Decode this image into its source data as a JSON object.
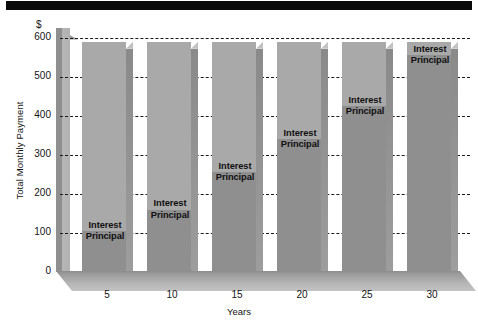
{
  "chart_data": {
    "type": "bar",
    "title": "",
    "subtitle": "",
    "xlabel": "Years",
    "ylabel": "Total Monthly Payment",
    "currency_symbol": "$",
    "categories": [
      "5",
      "10",
      "15",
      "20",
      "25",
      "30"
    ],
    "ytick_labels": [
      "600",
      "500",
      "400",
      "300",
      "200",
      "100",
      "0"
    ],
    "ytick_values": [
      600,
      500,
      400,
      300,
      200,
      100,
      0
    ],
    "ylim": [
      0,
      625
    ],
    "grid": true,
    "grid_style": "dashed-horizontal",
    "legend": "in-bar",
    "stacked": true,
    "series": [
      {
        "name": "Interest",
        "values": [
          485,
          430,
          335,
          250,
          165,
          35
        ]
      },
      {
        "name": "Principal",
        "values": [
          105,
          160,
          255,
          340,
          425,
          555
        ]
      }
    ],
    "totals": [
      590,
      590,
      590,
      590,
      590,
      590
    ],
    "bar_labels": [
      "Interest",
      "Principal"
    ],
    "colors": {
      "interest": "#a9a9a9",
      "principal": "#8f8f8f",
      "bar_side": "#8a8a8a",
      "floor": "#b4b4b4",
      "back_wall": "#9a9a9a",
      "gridline": "#1a1a1a",
      "text": "#141414",
      "top_rule": "#0a0a0a",
      "background": "#ffffff"
    }
  },
  "axis": {
    "y_title": "Total Monthly Payment",
    "y_currency": "$",
    "x_title": "Years"
  },
  "bars": [
    {
      "category": "5",
      "total": 590,
      "interest": 485,
      "principal": 105,
      "label_interest": "Interest",
      "label_principal": "Principal"
    },
    {
      "category": "10",
      "total": 590,
      "interest": 430,
      "principal": 160,
      "label_interest": "Interest",
      "label_principal": "Principal"
    },
    {
      "category": "15",
      "total": 590,
      "interest": 335,
      "principal": 255,
      "label_interest": "Interest",
      "label_principal": "Principal"
    },
    {
      "category": "20",
      "total": 590,
      "interest": 250,
      "principal": 340,
      "label_interest": "Interest",
      "label_principal": "Principal"
    },
    {
      "category": "25",
      "total": 590,
      "interest": 165,
      "principal": 425,
      "label_interest": "Interest",
      "label_principal": "Principal"
    },
    {
      "category": "30",
      "total": 590,
      "interest": 35,
      "principal": 555,
      "label_interest": "Interest",
      "label_principal": "Principal"
    }
  ]
}
